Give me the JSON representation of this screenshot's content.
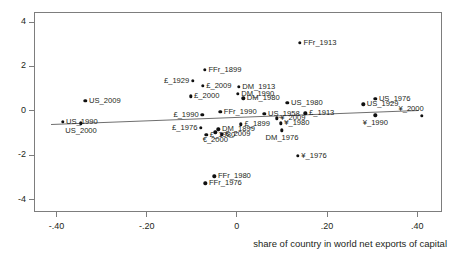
{
  "chart_data": {
    "type": "scatter",
    "title": "",
    "xlabel": "share of country in world net exports of capital",
    "ylabel": "",
    "xlim": [
      -0.45,
      0.455
    ],
    "ylim": [
      -4.55,
      4.45
    ],
    "xticks": [
      -0.4,
      -0.2,
      0,
      0.2,
      0.4
    ],
    "xticklabels": [
      "-.40",
      "-.20",
      "0",
      ".20",
      ".40"
    ],
    "yticks": [
      4,
      2,
      0,
      -2,
      -4
    ],
    "yticklabels": [
      "4",
      "2",
      "0",
      "-2",
      "-4"
    ],
    "grid": false,
    "legend": "none",
    "points": [
      {
        "label": "US_2009",
        "x": -0.338,
        "y": 0.5,
        "pos": "r"
      },
      {
        "label": "US_1990",
        "x": -0.389,
        "y": -0.45,
        "pos": "r"
      },
      {
        "label": "US_2000",
        "x": -0.348,
        "y": -0.52,
        "pos": "below"
      },
      {
        "label": "FFr_1899",
        "x": -0.073,
        "y": 1.9,
        "pos": "r"
      },
      {
        "label": "£_1929",
        "x": -0.1,
        "y": 1.4,
        "pos": "l"
      },
      {
        "label": "£_2009",
        "x": -0.078,
        "y": 1.18,
        "pos": "r"
      },
      {
        "label": "£_2000",
        "x": -0.105,
        "y": 0.7,
        "pos": "r"
      },
      {
        "label": "£_1990",
        "x": -0.079,
        "y": -0.13,
        "pos": "l"
      },
      {
        "label": "FFr_1990",
        "x": -0.039,
        "y": 0.01,
        "pos": "r"
      },
      {
        "label": "£_1976",
        "x": -0.082,
        "y": -0.72,
        "pos": "l"
      },
      {
        "label": "DM_1899",
        "x": -0.043,
        "y": -0.78,
        "pos": "r"
      },
      {
        "label": "£_1980",
        "x": -0.07,
        "y": -1.02,
        "pos": "r"
      },
      {
        "label": "€_2000",
        "x": -0.05,
        "y": -0.92,
        "pos": "below"
      },
      {
        "label": "€_2009",
        "x": -0.036,
        "y": -1.0,
        "pos": "r"
      },
      {
        "label": "FFr_1980",
        "x": -0.052,
        "y": -2.9,
        "pos": "r"
      },
      {
        "label": "FFr_1976",
        "x": -0.072,
        "y": -3.22,
        "pos": "r"
      },
      {
        "label": "DM_1913",
        "x": 0.002,
        "y": 1.12,
        "pos": "r"
      },
      {
        "label": "DM_1990",
        "x": 0.0,
        "y": 0.82,
        "pos": "r"
      },
      {
        "label": "DM_1980",
        "x": 0.012,
        "y": 0.62,
        "pos": "r"
      },
      {
        "label": "£_1899",
        "x": 0.007,
        "y": -0.55,
        "pos": "r"
      },
      {
        "label": "US_1958",
        "x": 0.059,
        "y": -0.08,
        "pos": "r"
      },
      {
        "label": "US_1980",
        "x": 0.11,
        "y": 0.4,
        "pos": "r"
      },
      {
        "label": "¥_1980",
        "x": 0.095,
        "y": -0.52,
        "pos": "r"
      },
      {
        "label": "DM_1976",
        "x": 0.098,
        "y": -0.82,
        "pos": "below"
      },
      {
        "label": "¥_2009",
        "x": 0.086,
        "y": -0.28,
        "pos": "r"
      },
      {
        "label": "¥_1976",
        "x": 0.133,
        "y": -1.98,
        "pos": "r"
      },
      {
        "label": "FFr_1913",
        "x": 0.138,
        "y": 3.12,
        "pos": "r"
      },
      {
        "label": "£_1913",
        "x": 0.15,
        "y": -0.07,
        "pos": "r"
      },
      {
        "label": "US_1976",
        "x": 0.305,
        "y": 0.6,
        "pos": "r"
      },
      {
        "label": "US_1929",
        "x": 0.278,
        "y": 0.34,
        "pos": "r"
      },
      {
        "label": "¥_1990",
        "x": 0.305,
        "y": -0.15,
        "pos": "below"
      },
      {
        "label": "¥_2000",
        "x": 0.408,
        "y": -0.18,
        "pos": "above-l"
      }
    ],
    "fit_line": {
      "x0": -0.415,
      "y0": -0.56,
      "x1": 0.4,
      "y1": 0.07
    },
    "colors": {
      "point": "#101010",
      "frame": "#7d7d7d",
      "text": "#231f20",
      "fit_line": "#6f6f6f",
      "background": "#ffffff"
    }
  }
}
